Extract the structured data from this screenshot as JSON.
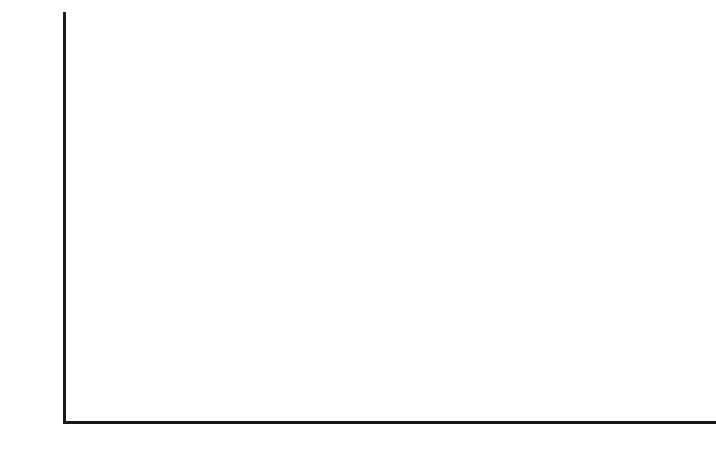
{
  "chart_data": {
    "type": "bar",
    "title": "",
    "subtitle": "",
    "xlabel": "",
    "ylabel": "",
    "xlim": [
      1970.5,
      2016.5
    ],
    "ylim": [
      0,
      5000
    ],
    "grid": false,
    "legend": null,
    "bar_color": "#888888",
    "axis_color": "#1a1a1a",
    "background_color": "#ffffff",
    "y_ticks": [
      0,
      1000,
      2000,
      3000,
      4000,
      5000
    ],
    "y_tick_labels": [
      "0",
      "1000",
      "2000",
      "3000",
      "4000",
      "5000"
    ],
    "x_ticks": [
      1974,
      1980,
      1986,
      1992,
      1998,
      2004,
      2010,
      2016
    ],
    "x_tick_labels": [
      "1974",
      "1980",
      "1986",
      "1992",
      "1998",
      "2004",
      "2010",
      "2016"
    ],
    "x_origin_label": "0",
    "categories": [
      1971,
      1972,
      1973,
      1974,
      1975,
      1976,
      1977,
      1978,
      1979,
      1980,
      1981,
      1982,
      1983,
      1984,
      1985,
      1986,
      1987,
      1988,
      1989,
      1990,
      1991,
      1992,
      1993,
      1994,
      1995,
      1996,
      1997,
      1998,
      1999,
      2000,
      2001,
      2002,
      2003,
      2004,
      2005,
      2006,
      2007,
      2008,
      2009,
      2010,
      2011,
      2012,
      2013,
      2014,
      2015,
      2016
    ],
    "values": [
      70,
      85,
      95,
      480,
      360,
      345,
      330,
      195,
      530,
      610,
      490,
      500,
      500,
      490,
      545,
      1490,
      1720,
      1820,
      1810,
      1920,
      1890,
      1960,
      1940,
      2110,
      2220,
      1440,
      1650,
      1650,
      1650,
      2080,
      2270,
      2460,
      2520,
      2460,
      2450,
      3030,
      3380,
      3400,
      3370,
      3400,
      3330,
      3590,
      4840,
      4130,
      4650,
      0
    ]
  }
}
